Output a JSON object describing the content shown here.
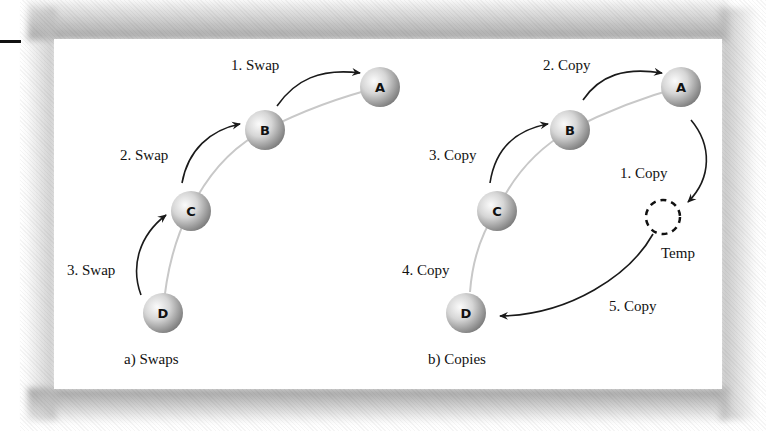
{
  "figure": {
    "panels": [
      {
        "id": "swaps",
        "caption": "a) Swaps",
        "nodes": [
          "A",
          "B",
          "C",
          "D"
        ],
        "steps": [
          {
            "label": "1. Swap",
            "from": "B",
            "to": "A"
          },
          {
            "label": "2. Swap",
            "from": "C",
            "to": "B"
          },
          {
            "label": "3. Swap",
            "from": "D",
            "to": "C"
          }
        ]
      },
      {
        "id": "copies",
        "caption": "b) Copies",
        "nodes": [
          "A",
          "B",
          "C",
          "D"
        ],
        "temp_label": "Temp",
        "steps": [
          {
            "label": "1. Copy",
            "from": "A",
            "to": "Temp"
          },
          {
            "label": "2. Copy",
            "from": "B",
            "to": "A"
          },
          {
            "label": "3. Copy",
            "from": "C",
            "to": "B"
          },
          {
            "label": "4. Copy",
            "from": "D",
            "to": "C"
          },
          {
            "label": "5. Copy",
            "from": "Temp",
            "to": "D"
          }
        ]
      }
    ]
  },
  "colors": {
    "arrow": "#1a1a1a",
    "path_line": "#c8c8c8",
    "node_light": "#f4f4f4",
    "node_dark": "#8a8a8a",
    "panel_bg": "#ffffff",
    "shadow": "#9a9a9a"
  }
}
